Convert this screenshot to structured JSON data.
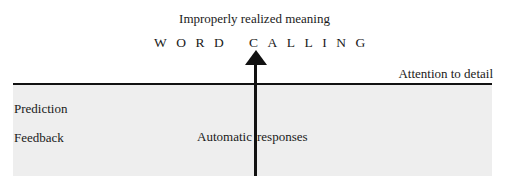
{
  "diagram": {
    "top_label": "Improperly realized meaning",
    "outcome_words": [
      "WORD",
      "CALLING"
    ],
    "threshold_label": "Attention to detail",
    "left_labels": [
      "Prediction",
      "Feedback"
    ],
    "center_label_left": "Automatic",
    "center_label_right": "responses",
    "colors": {
      "background": "#ffffff",
      "shaded_region": "#eeeeee",
      "lines": "#111111"
    }
  }
}
